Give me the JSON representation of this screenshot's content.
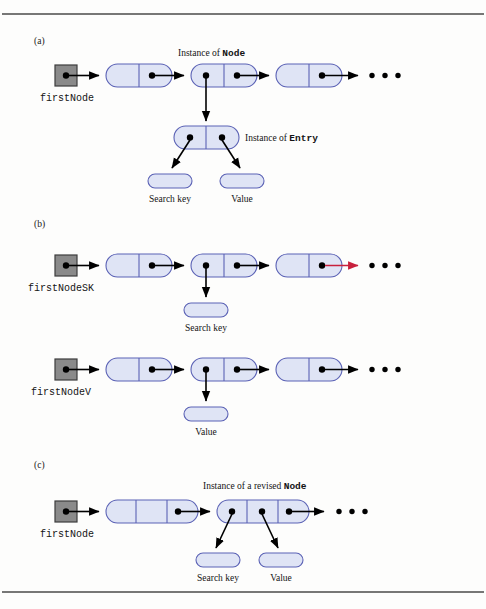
{
  "figure": {
    "kind": "linked-list-node-diagram",
    "panels": [
      {
        "id": "a",
        "label": "(a)",
        "pointer_label": "firstNode",
        "headings": [
          {
            "prefix": "Instance of ",
            "code": "Node"
          },
          {
            "prefix": "Instance of ",
            "code": "Entry"
          }
        ],
        "pill_labels": [
          "Search key",
          "Value"
        ],
        "chain_node_cells": 2,
        "chain_length": 3,
        "ellipsis": "• • •"
      },
      {
        "id": "b",
        "label": "(b)",
        "rows": [
          {
            "pointer_label": "firstNodeSK",
            "pill_label": "Search key",
            "chain_node_cells": 2,
            "chain_length": 3,
            "tail_link_color": "#c8203c"
          },
          {
            "pointer_label": "firstNodeV",
            "pill_label": "Value",
            "chain_node_cells": 2,
            "chain_length": 3,
            "tail_link_color": "#000000"
          }
        ],
        "ellipsis": "• • •"
      },
      {
        "id": "c",
        "label": "(c)",
        "pointer_label": "firstNode",
        "heading": {
          "prefix": "Instance of a revised ",
          "code": "Node"
        },
        "pill_labels": [
          "Search key",
          "Value"
        ],
        "chain_node_cells": 3,
        "chain_length": 2,
        "ellipsis": "• • •"
      }
    ],
    "colors": {
      "cell_fill": "#dfe4f5",
      "cell_stroke": "#5b62b5",
      "ref_box_fill": "#8a8a8a",
      "ref_box_stroke": "#3c3c3c",
      "link": "#000000",
      "link_highlight": "#c8203c",
      "rule": "#4a4a4a",
      "page": "#fdfdfc"
    }
  }
}
